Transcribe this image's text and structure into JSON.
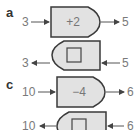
{
  "parts": [
    {
      "label": "a",
      "forward": {
        "input": "3",
        "operation": "+2",
        "output": "5"
      },
      "inverse": {
        "input": "5",
        "operation_box": "empty-square",
        "output": "3"
      }
    },
    {
      "label": "c",
      "forward": {
        "input": "10",
        "operation": "−4",
        "output": "6"
      },
      "inverse": {
        "input": "6",
        "operation_box": "empty-square",
        "output": "10"
      }
    }
  ],
  "colors": {
    "box_fill": "#e2e2e2",
    "box_stroke": "#3a3a3a",
    "arrow": "#555555",
    "text": "#777777"
  }
}
